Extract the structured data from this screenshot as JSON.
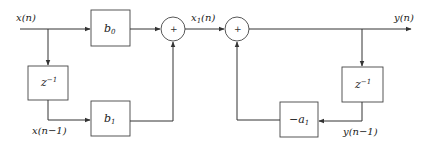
{
  "diagram": {
    "title": "",
    "type": "IIR first-order filter block diagram (Direct Form I)",
    "signals": {
      "input": "x(n)",
      "input_delayed": "x(n−1)",
      "intermediate": "x",
      "intermediate_sub": "1",
      "intermediate_arg": "(n)",
      "output": "y(n)",
      "output_delayed": "y(n−1)"
    },
    "blocks": {
      "b0": {
        "base": "b",
        "sub": "0"
      },
      "b1": {
        "base": "b",
        "sub": "1"
      },
      "delay_left": {
        "base": "z",
        "sup": "−1"
      },
      "delay_right": {
        "base": "z",
        "sup": "−1"
      },
      "neg_a1": {
        "base": "−a",
        "sub": "1"
      }
    },
    "adders": {
      "adder1": {
        "symbol": "+"
      },
      "adder2": {
        "symbol": "+"
      }
    },
    "colors": {
      "line": "#333333",
      "box_border": "#444444",
      "background": "#ffffff"
    }
  }
}
